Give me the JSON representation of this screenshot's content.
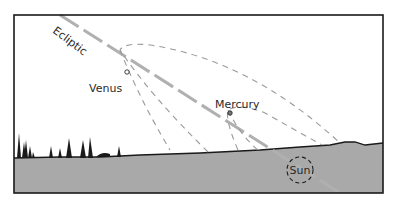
{
  "diagram": {
    "labels": {
      "ecliptic": "Ecliptic",
      "venus": "Venus",
      "mercury": "Mercury",
      "sun": "Sun"
    },
    "colors": {
      "sky": "#ffffff",
      "ground": "#a9a9a9",
      "frame": "#1a1a1a",
      "ecliptic_line": "#b0b0b0",
      "orbit_dash": "#9a9a9a",
      "horizon": "#1a1a1a",
      "trees": "#1a1a1a"
    }
  }
}
